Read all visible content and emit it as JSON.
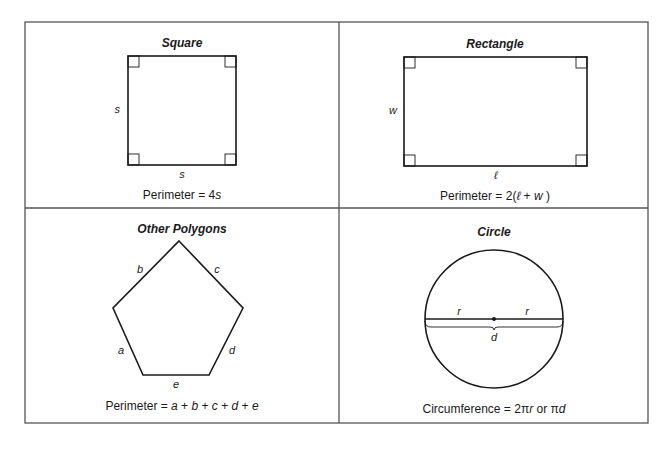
{
  "panels": {
    "square": {
      "title": "Square",
      "side_label_left": "s",
      "side_label_bottom": "s",
      "formula_prefix": "Perimeter = 4",
      "formula_var": "s"
    },
    "rectangle": {
      "title": "Rectangle",
      "side_label_left": "w",
      "side_label_bottom": "ℓ",
      "formula_prefix": "Perimeter = 2(",
      "formula_var1": "ℓ",
      "formula_plus": " + ",
      "formula_var2": "w",
      "formula_suffix": " )"
    },
    "polygon": {
      "title": "Other Polygons",
      "labels": {
        "a": "a",
        "b": "b",
        "c": "c",
        "d": "d",
        "e": "e"
      },
      "formula_prefix": "Perimeter = ",
      "formula_terms": [
        "a",
        "b",
        "c",
        "d",
        "e"
      ],
      "formula_sep": " + "
    },
    "circle": {
      "title": "Circle",
      "radius_label_left": "r",
      "radius_label_right": "r",
      "diameter_label": "d",
      "formula_prefix": "Circumference = 2π",
      "formula_var_r": "r",
      "formula_mid": " or π",
      "formula_var_d": "d"
    }
  },
  "colors": {
    "line": "#1a1a1a",
    "frame": "#555555",
    "background": "#ffffff"
  }
}
